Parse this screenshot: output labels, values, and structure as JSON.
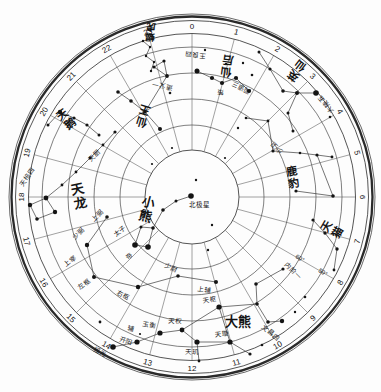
{
  "chart_data": {
    "type": "polar-star-map",
    "description_labels": {
      "pole_star": "北极星"
    },
    "geometry": {
      "width": 381,
      "height": 392,
      "cx": 192,
      "cy": 197,
      "rings": [
        {
          "r": 183,
          "w": 0.7
        },
        {
          "r": 180.5,
          "w": 2.3
        },
        {
          "r": 176.5,
          "w": 0.8
        },
        {
          "r": 163.5,
          "w": 0.8
        },
        {
          "r": 150,
          "w": 0.6
        },
        {
          "r": 124,
          "w": 0.6
        },
        {
          "r": 98,
          "w": 0.6
        },
        {
          "r": 72,
          "w": 0.6
        },
        {
          "r": 47,
          "w": 0.8
        }
      ],
      "radials": {
        "inner": 47,
        "outer": 163.5,
        "count": 24
      },
      "hour_label_radius": 171
    },
    "hour_labels": [
      "0",
      "1",
      "2",
      "3",
      "4",
      "5",
      "6",
      "7",
      "8",
      "9",
      "10",
      "11",
      "12",
      "13",
      "14",
      "15",
      "16",
      "17",
      "18",
      "19",
      "20",
      "21",
      "22",
      "23"
    ],
    "declination_labels": [
      {
        "t": "60°",
        "x": 300,
        "y": 258,
        "rot": 32
      },
      {
        "t": "50°",
        "x": 323,
        "y": 272,
        "rot": 32
      }
    ],
    "constellations": [
      {
        "name": "仙后",
        "x": 227,
        "y": 66,
        "rot": 188,
        "size": 11,
        "dir": "v"
      },
      {
        "name": "英仙",
        "x": 297,
        "y": 71,
        "rot": 217,
        "size": 11,
        "dir": "v"
      },
      {
        "name": "仙王",
        "x": 143,
        "y": 116,
        "rot": 197,
        "size": 11,
        "dir": "v"
      },
      {
        "name": "蝎虎",
        "x": 150,
        "y": 32,
        "rot": 184,
        "size": 9.5,
        "dir": "v"
      },
      {
        "name": "天鹅",
        "x": 66,
        "y": 119,
        "rot": -37,
        "size": 11,
        "dir": "v"
      },
      {
        "name": "天龙",
        "x": 79,
        "y": 196,
        "rot": -12,
        "size": 13,
        "dir": "v"
      },
      {
        "name": "小熊",
        "x": 147,
        "y": 209,
        "rot": 15,
        "size": 13,
        "dir": "v"
      },
      {
        "name": "大熊",
        "x": 238,
        "y": 321,
        "rot": 0,
        "size": 13,
        "dir": "h"
      },
      {
        "name": "鹿豹",
        "x": 293,
        "y": 177,
        "rot": -10,
        "size": 11,
        "dir": "v"
      },
      {
        "name": "天猫",
        "x": 332,
        "y": 229,
        "rot": -60,
        "size": 11,
        "dir": "v"
      }
    ],
    "star_names": [
      {
        "t": "北极星",
        "x": 199,
        "y": 205,
        "rot": 0
      },
      {
        "t": "太子",
        "x": 120,
        "y": 231,
        "rot": -38
      },
      {
        "t": "帝",
        "x": 129,
        "y": 256,
        "rot": -38
      },
      {
        "t": "右枢",
        "x": 123,
        "y": 295,
        "rot": 28
      },
      {
        "t": "少尉",
        "x": 171,
        "y": 268,
        "rot": 22
      },
      {
        "t": "上辅",
        "x": 204,
        "y": 290,
        "rot": 8
      },
      {
        "t": "左枢",
        "x": 84,
        "y": 284,
        "rot": -42
      },
      {
        "t": "上宰",
        "x": 70,
        "y": 261,
        "rot": -42
      },
      {
        "t": "少弼",
        "x": 78,
        "y": 233,
        "rot": -45
      },
      {
        "t": "上弼",
        "x": 97,
        "y": 215,
        "rot": -45
      },
      {
        "t": "天棓四",
        "x": 27,
        "y": 177,
        "rot": -55
      },
      {
        "t": "天厨",
        "x": 94,
        "y": 155,
        "rot": -45
      },
      {
        "t": "摇光",
        "x": 100,
        "y": 352,
        "rot": 25
      },
      {
        "t": "开阳",
        "x": 126,
        "y": 341,
        "rot": 18
      },
      {
        "t": "辅",
        "x": 131,
        "y": 329,
        "rot": 15
      },
      {
        "t": "玉衡",
        "x": 149,
        "y": 325,
        "rot": 10
      },
      {
        "t": "天权",
        "x": 175,
        "y": 321,
        "rot": 5
      },
      {
        "t": "天玑",
        "x": 192,
        "y": 352,
        "rot": 3
      },
      {
        "t": "天璇",
        "x": 222,
        "y": 334,
        "rot": -5
      },
      {
        "t": "天枢",
        "x": 210,
        "y": 300,
        "rot": -8
      },
      {
        "t": "内阶一",
        "x": 293,
        "y": 271,
        "rot": 45
      },
      {
        "t": "文昌四",
        "x": 271,
        "y": 333,
        "rot": 40
      },
      {
        "t": "少卫",
        "x": 276,
        "y": 148,
        "rot": 225
      },
      {
        "t": "王良四",
        "x": 195,
        "y": 55,
        "rot": 185
      },
      {
        "t": "策",
        "x": 220,
        "y": 92,
        "rot": 185
      },
      {
        "t": "阁道三",
        "x": 241,
        "y": 88,
        "rot": 205
      },
      {
        "t": "造父一",
        "x": 162,
        "y": 86,
        "rot": 190
      },
      {
        "t": "大陵五",
        "x": 326,
        "y": 104,
        "rot": 230
      }
    ],
    "stars": [
      [
        191,
        196,
        2.8
      ],
      [
        196,
        180,
        1.2
      ],
      [
        212,
        225,
        1.2
      ],
      [
        208,
        250,
        1.2
      ],
      [
        176,
        201,
        1.5
      ],
      [
        163,
        210,
        1.8
      ],
      [
        153,
        228,
        1.8
      ],
      [
        148,
        247,
        2.8
      ],
      [
        135,
        245,
        2.8
      ],
      [
        141,
        227,
        1.5
      ],
      [
        216,
        282,
        2.0
      ],
      [
        178,
        276,
        1.8
      ],
      [
        138,
        287,
        2.2
      ],
      [
        94,
        277,
        2.0
      ],
      [
        87,
        245,
        2.2
      ],
      [
        107,
        217,
        1.8
      ],
      [
        30,
        205,
        2.2
      ],
      [
        46,
        198,
        2.4
      ],
      [
        55,
        212,
        2.2
      ],
      [
        37,
        219,
        1.8
      ],
      [
        62,
        185,
        1.4
      ],
      [
        76,
        172,
        1.4
      ],
      [
        90,
        158,
        1.4
      ],
      [
        103,
        145,
        1.4
      ],
      [
        115,
        132,
        1.6
      ],
      [
        118,
        92,
        1.8
      ],
      [
        131,
        101,
        1.8
      ],
      [
        145,
        112,
        1.8
      ],
      [
        160,
        129,
        2.0
      ],
      [
        154,
        67,
        1.6
      ],
      [
        164,
        61,
        1.6
      ],
      [
        167,
        76,
        1.9
      ],
      [
        170,
        93,
        1.3
      ],
      [
        143,
        41,
        1.2
      ],
      [
        150,
        47,
        1.2
      ],
      [
        146,
        56,
        1.2
      ],
      [
        154,
        62,
        1.2
      ],
      [
        151,
        71,
        1.2
      ],
      [
        197,
        71,
        2.5
      ],
      [
        212,
        78,
        2.1
      ],
      [
        222,
        83,
        2.1
      ],
      [
        236,
        78,
        2.1
      ],
      [
        249,
        91,
        2.1
      ],
      [
        205,
        50,
        1.2
      ],
      [
        226,
        64,
        1.2
      ],
      [
        243,
        63,
        1.2
      ],
      [
        252,
        75,
        1.3
      ],
      [
        259,
        52,
        1.5
      ],
      [
        270,
        69,
        1.6
      ],
      [
        283,
        91,
        1.8
      ],
      [
        297,
        93,
        2.0
      ],
      [
        316,
        93,
        2.8
      ],
      [
        288,
        113,
        1.5
      ],
      [
        293,
        131,
        1.5
      ],
      [
        330,
        117,
        1.3
      ],
      [
        246,
        118,
        1.3
      ],
      [
        268,
        121,
        1.4
      ],
      [
        273,
        151,
        1.6
      ],
      [
        300,
        153,
        1.3
      ],
      [
        317,
        155,
        1.6
      ],
      [
        332,
        157,
        1.4
      ],
      [
        296,
        191,
        1.6
      ],
      [
        333,
        196,
        1.8
      ],
      [
        313,
        220,
        1.6
      ],
      [
        325,
        233,
        1.7
      ],
      [
        337,
        249,
        1.7
      ],
      [
        334,
        270,
        1.4
      ],
      [
        219,
        307,
        2.6
      ],
      [
        230,
        342,
        2.6
      ],
      [
        197,
        342,
        2.6
      ],
      [
        182,
        330,
        2.4
      ],
      [
        160,
        333,
        2.6
      ],
      [
        137,
        342,
        2.6
      ],
      [
        140,
        334,
        1.1
      ],
      [
        113,
        347,
        2.8
      ],
      [
        283,
        269,
        1.6
      ],
      [
        256,
        284,
        1.8
      ],
      [
        257,
        304,
        1.8
      ],
      [
        268,
        322,
        1.8
      ],
      [
        282,
        321,
        2.2
      ],
      [
        295,
        312,
        1.2
      ],
      [
        250,
        354,
        1.6
      ],
      [
        199,
        361,
        1.4
      ],
      [
        262,
        345,
        1.3
      ],
      [
        48,
        125,
        1.5
      ],
      [
        60,
        112,
        2.2
      ],
      [
        74,
        118,
        1.6
      ],
      [
        87,
        125,
        1.6
      ],
      [
        99,
        135,
        1.5
      ],
      [
        238,
        128,
        1.2
      ],
      [
        225,
        158,
        1.1
      ],
      [
        172,
        148,
        1.1
      ],
      [
        152,
        164,
        1.1
      ],
      [
        305,
        297,
        1.3
      ],
      [
        100,
        322,
        1.4
      ]
    ],
    "lines": [
      [
        [
          191,
          196
        ],
        [
          176,
          201
        ],
        [
          163,
          210
        ],
        [
          153,
          228
        ]
      ],
      [
        [
          153,
          228
        ],
        [
          148,
          247
        ],
        [
          135,
          245
        ],
        [
          141,
          227
        ],
        [
          153,
          228
        ]
      ],
      [
        [
          107,
          217
        ],
        [
          87,
          245
        ],
        [
          94,
          277
        ],
        [
          138,
          287
        ],
        [
          178,
          276
        ],
        [
          216,
          282
        ]
      ],
      [
        [
          30,
          205
        ],
        [
          46,
          198
        ],
        [
          55,
          212
        ],
        [
          37,
          219
        ],
        [
          30,
          205
        ]
      ],
      [
        [
          46,
          198
        ],
        [
          62,
          185
        ],
        [
          76,
          172
        ],
        [
          90,
          158
        ],
        [
          103,
          145
        ],
        [
          115,
          132
        ]
      ],
      [
        [
          118,
          92
        ],
        [
          131,
          101
        ],
        [
          145,
          112
        ],
        [
          160,
          129
        ]
      ],
      [
        [
          145,
          112
        ],
        [
          167,
          76
        ]
      ],
      [
        [
          154,
          67
        ],
        [
          164,
          61
        ],
        [
          167,
          76
        ],
        [
          154,
          67
        ]
      ],
      [
        [
          143,
          41
        ],
        [
          150,
          47
        ],
        [
          146,
          56
        ],
        [
          154,
          62
        ],
        [
          151,
          71
        ]
      ],
      [
        [
          197,
          71
        ],
        [
          212,
          78
        ],
        [
          222,
          83
        ],
        [
          236,
          78
        ],
        [
          249,
          91
        ]
      ],
      [
        [
          259,
          52
        ],
        [
          270,
          69
        ],
        [
          283,
          91
        ],
        [
          297,
          93
        ],
        [
          316,
          93
        ]
      ],
      [
        [
          297,
          93
        ],
        [
          288,
          113
        ],
        [
          293,
          131
        ]
      ],
      [
        [
          246,
          118
        ],
        [
          268,
          121
        ]
      ],
      [
        [
          268,
          121
        ],
        [
          273,
          151
        ],
        [
          300,
          153
        ],
        [
          317,
          155
        ],
        [
          332,
          157
        ]
      ],
      [
        [
          317,
          155
        ],
        [
          333,
          196
        ],
        [
          296,
          191
        ]
      ],
      [
        [
          313,
          220
        ],
        [
          325,
          233
        ],
        [
          337,
          249
        ],
        [
          334,
          270
        ]
      ],
      [
        [
          219,
          307
        ],
        [
          230,
          342
        ],
        [
          197,
          342
        ],
        [
          182,
          330
        ],
        [
          219,
          307
        ]
      ],
      [
        [
          182,
          330
        ],
        [
          160,
          333
        ],
        [
          137,
          342
        ],
        [
          113,
          347
        ]
      ],
      [
        [
          230,
          342
        ],
        [
          250,
          354
        ]
      ],
      [
        [
          197,
          342
        ],
        [
          199,
          361
        ]
      ],
      [
        [
          283,
          269
        ],
        [
          256,
          284
        ],
        [
          257,
          304
        ],
        [
          268,
          322
        ],
        [
          282,
          321
        ]
      ],
      [
        [
          219,
          307
        ],
        [
          257,
          304
        ]
      ],
      [
        [
          48,
          125
        ],
        [
          60,
          112
        ],
        [
          74,
          118
        ],
        [
          87,
          125
        ],
        [
          99,
          135
        ]
      ]
    ],
    "colors": {
      "ink": "#141414",
      "line": "#3a3a3a",
      "ring": "#2a2a2a",
      "background": "#fdfdfd"
    }
  }
}
